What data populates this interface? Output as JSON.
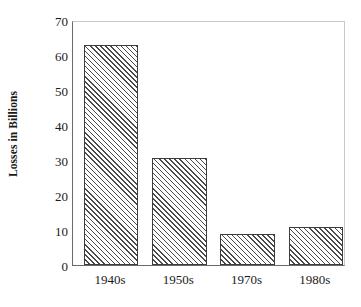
{
  "chart_data": {
    "type": "bar",
    "title": "",
    "subtitle": "",
    "xlabel": "",
    "ylabel": "Losses in Billions",
    "categories": [
      "1940s",
      "1950s",
      "1970s",
      "1980s"
    ],
    "values": [
      63,
      30.5,
      9,
      11
    ],
    "series": [
      {
        "name": "Losses in Billions",
        "values": [
          63,
          30.5,
          9,
          11
        ]
      }
    ],
    "ylim": [
      0,
      70
    ],
    "ytick_labels": [
      "0",
      "10",
      "20",
      "30",
      "40",
      "50",
      "60",
      "70"
    ],
    "ytick_values": [
      0,
      10,
      20,
      30,
      40,
      50,
      60,
      70
    ],
    "ytick_step": 10,
    "grid": false,
    "legend": false,
    "legend_position": "none",
    "bar_fill": "hatched-diagonal",
    "bar_edge_color": "#3d3d3d",
    "axis_color": "#6a6a6a",
    "background_color": "#ffffff",
    "annotations": []
  },
  "axes": {
    "y_title": "Losses in Billions"
  }
}
